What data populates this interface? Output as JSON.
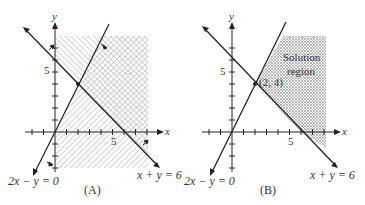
{
  "figure": {
    "panels": [
      {
        "id": "A",
        "caption": "(A)",
        "axis_labels": {
          "x": "x",
          "y": "y"
        },
        "tick_labels": {
          "x5": "5",
          "y5": "5"
        },
        "lines": [
          {
            "equation": "2x − y = 0",
            "label": "2x − y = 0"
          },
          {
            "equation": "x + y = 6",
            "label": "x + y = 6"
          }
        ],
        "shading": "Both half-planes hatched: 2x − y ≤ 0 side hatched one direction; x + y ≥ 6 side hatched other; overlap cross-hatched"
      },
      {
        "id": "B",
        "caption": "(B)",
        "axis_labels": {
          "x": "x",
          "y": "y"
        },
        "tick_labels": {
          "x5": "5",
          "y5": "5"
        },
        "lines": [
          {
            "equation": "2x − y = 0",
            "label": "2x − y = 0"
          },
          {
            "equation": "x + y = 6",
            "label": "x + y = 6"
          }
        ],
        "intersection_label": "(2, 4)",
        "region_label_line1": "Solution",
        "region_label_line2": "region"
      }
    ],
    "colors": {
      "line": "#222222",
      "hatch": "#9a9a9a",
      "text": "#333333"
    }
  }
}
